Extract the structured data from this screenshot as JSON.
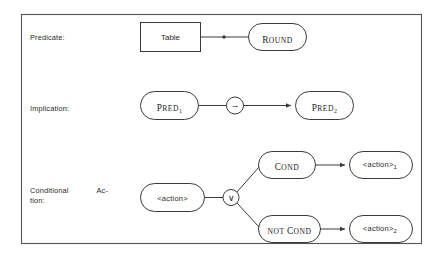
{
  "figure": {
    "border_color": "#555555",
    "line_color": "#3a3a3a",
    "text_color": "#2b2b2b",
    "background": "#ffffff"
  },
  "rows": [
    {
      "id": "predicate",
      "label": "Predicate:",
      "nodes": [
        {
          "id": "table",
          "text": "Table",
          "shape": "rectangle"
        },
        {
          "id": "round",
          "text_cap": "R",
          "text_rest": "OUND",
          "shape": "rounded"
        }
      ],
      "edges": [
        {
          "from": "table",
          "to": "round",
          "marker": "dot"
        }
      ]
    },
    {
      "id": "implication",
      "label": "Implication:",
      "nodes": [
        {
          "id": "pred1",
          "text_cap": "P",
          "text_rest": "RED",
          "subscript": "1",
          "shape": "rounded"
        },
        {
          "id": "pred2",
          "text_cap": "P",
          "text_rest": "RED",
          "subscript": "2",
          "shape": "rounded"
        }
      ],
      "operator": {
        "id": "implies",
        "symbol": "→",
        "shape": "circle"
      },
      "edges": [
        {
          "from": "pred1",
          "to": "implies",
          "marker": "none"
        },
        {
          "from": "implies",
          "to": "pred2",
          "marker": "arrow"
        }
      ]
    },
    {
      "id": "conditional-action",
      "label_line1_left": "Conditional",
      "label_line1_right": "Ac-",
      "label_line2": "tion:",
      "nodes": [
        {
          "id": "action",
          "text": "<action>",
          "shape": "rounded"
        },
        {
          "id": "cond",
          "text_cap": "C",
          "text_rest": "OND",
          "shape": "rounded"
        },
        {
          "id": "notcond",
          "text_small": "NOT",
          "text_cap": "C",
          "text_rest": "OND",
          "shape": "rounded"
        },
        {
          "id": "action1",
          "text": "<action>",
          "subscript": "1",
          "shape": "rounded"
        },
        {
          "id": "action2",
          "text": "<action>",
          "subscript": "2",
          "shape": "rounded"
        }
      ],
      "operator": {
        "id": "or",
        "symbol": "∨",
        "shape": "circle"
      },
      "edges": [
        {
          "from": "action",
          "to": "or",
          "marker": "none"
        },
        {
          "from": "or",
          "to": "cond",
          "marker": "none"
        },
        {
          "from": "or",
          "to": "notcond",
          "marker": "none"
        },
        {
          "from": "cond",
          "to": "action1",
          "marker": "arrow"
        },
        {
          "from": "notcond",
          "to": "action2",
          "marker": "arrow"
        }
      ]
    }
  ]
}
